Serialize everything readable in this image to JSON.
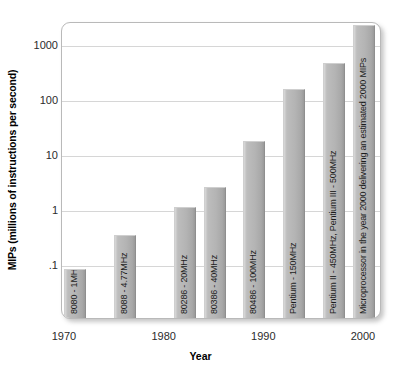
{
  "chart_data": {
    "type": "bar",
    "title": "",
    "xlabel": "Year",
    "ylabel": "MIPs (millions of instructions per second)",
    "yscale": "log",
    "ylim": [
      0.05,
      3000
    ],
    "xlim": [
      1968,
      2002
    ],
    "grid": true,
    "legend": "none",
    "ytick_labels": [
      "1000",
      "100",
      "10",
      "1",
      ".1"
    ],
    "ytick_values": [
      1000,
      100,
      10,
      1,
      0.1
    ],
    "xtick_labels": [
      "1970",
      "1980",
      "1990",
      "2000"
    ],
    "xtick_values": [
      1970,
      1980,
      1990,
      2000
    ],
    "categories": [
      "8080 - 1MHz",
      "8088 - 4.77MHz",
      "80286 - 20MHz",
      "80386 - 40MHz",
      "80486 - 100MHz",
      "Pentium - 150MHz",
      "Pentium II - 450MHz, Pentium III - 500MHz",
      "Microprocessor in the year 2000 delivering an estimated 2000 MIPs"
    ],
    "values": [
      0.08,
      0.33,
      1.1,
      2.5,
      17,
      150,
      450,
      2200
    ],
    "x": [
      1971,
      1976,
      1982,
      1985,
      1989,
      1993,
      1997,
      2000
    ],
    "bars": [
      {
        "label": "8080 - 1MHz",
        "year": 1971,
        "value": 0.08
      },
      {
        "label": "8088 - 4.77MHz",
        "year": 1976,
        "value": 0.33
      },
      {
        "label": "80286 - 20MHz",
        "year": 1982,
        "value": 1.1
      },
      {
        "label": "80386 - 40MHz",
        "year": 1985,
        "value": 2.5
      },
      {
        "label": "80486 - 100MHz",
        "year": 1989,
        "value": 17
      },
      {
        "label": "Pentium - 150MHz",
        "year": 1993,
        "value": 150
      },
      {
        "label": "Pentium II - 450MHz, Pentium III - 500MHz",
        "year": 1997,
        "value": 450
      },
      {
        "label": "Microprocessor in the year 2000 delivering an estimated 2000 MIPs",
        "year": 2000,
        "value": 2200
      }
    ],
    "colors": {
      "bar_fill": "#b4b4b4",
      "bar_edge": "#8f8f8f",
      "grid": "#d6d6d6",
      "frame": "#b9b9b9",
      "background": "#ffffff",
      "text": "#1a1a1a"
    }
  }
}
